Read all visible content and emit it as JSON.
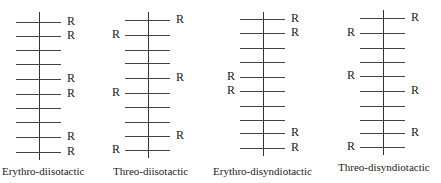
{
  "diagrams": [
    {
      "caption": "Erythro-diisotactic",
      "axis_x": 39,
      "line_left": 16,
      "line_right": 61,
      "top": 12,
      "bottom": 160,
      "rows": [
        22,
        36,
        50,
        64,
        79,
        94,
        108,
        122,
        137,
        152
      ],
      "r_right": [
        0,
        1,
        4,
        5,
        8,
        9
      ],
      "r_left": [],
      "r_label": "R",
      "caption_left": 2
    },
    {
      "caption": "Threo-diisotactic",
      "axis_x": 148,
      "line_left": 125,
      "line_right": 170,
      "top": 12,
      "bottom": 158,
      "rows": [
        20,
        35,
        50,
        63,
        78,
        93,
        107,
        122,
        136,
        150
      ],
      "r_right": [
        0,
        4,
        8
      ],
      "r_left": [
        1,
        5,
        9
      ],
      "r_label": "R",
      "caption_left": 113
    },
    {
      "caption": "Erythro-disyndiotactic",
      "axis_x": 263,
      "line_left": 240,
      "line_right": 285,
      "top": 12,
      "bottom": 156,
      "rows": [
        19,
        33,
        48,
        62,
        77,
        91,
        106,
        120,
        133,
        148
      ],
      "r_right": [
        0,
        1,
        8,
        9
      ],
      "r_left": [
        4,
        5
      ],
      "r_label": "R",
      "caption_left": 213
    },
    {
      "caption": "Threo-disyndiotactic",
      "axis_x": 383,
      "line_left": 360,
      "line_right": 405,
      "top": 10,
      "bottom": 155,
      "rows": [
        18,
        33,
        48,
        62,
        76,
        91,
        106,
        120,
        133,
        147
      ],
      "r_right": [
        0,
        5,
        8
      ],
      "r_left": [
        1,
        4,
        9
      ],
      "r_label": "R",
      "caption_left": 338
    }
  ]
}
